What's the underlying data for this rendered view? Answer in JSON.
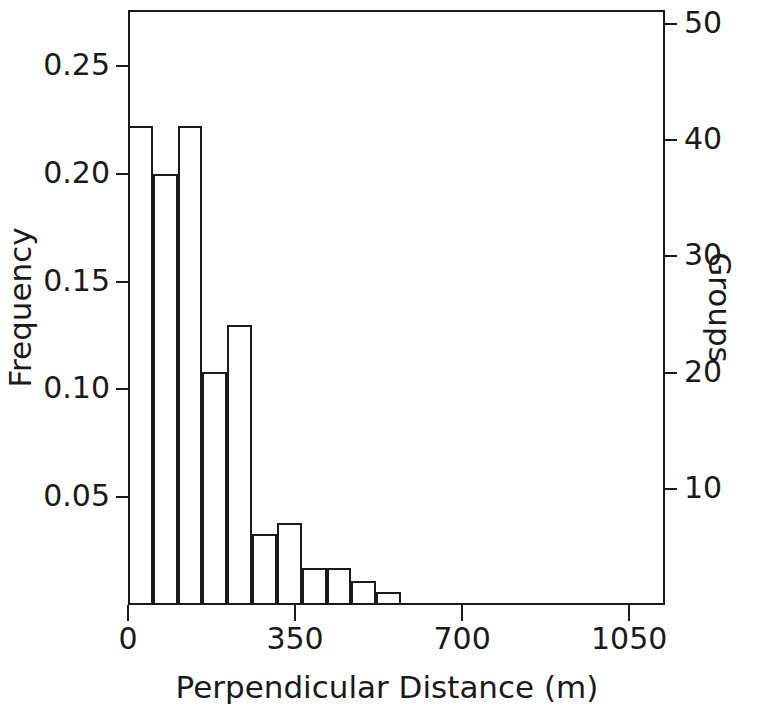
{
  "chart_data": {
    "type": "bar",
    "title": "",
    "subtitle": "",
    "xlabel": "Perpendicular  Distance  (m)",
    "ylabel": "Frequency",
    "y2label": "Groups",
    "grid": false,
    "legend": null,
    "xlim": [
      0,
      1125
    ],
    "ylim": [
      0,
      0.276
    ],
    "y2lim": [
      0,
      51.2
    ],
    "xticks": [
      0,
      350,
      700,
      1050
    ],
    "xticklabels": [
      "0",
      "350",
      "700",
      "1050"
    ],
    "yticks": [
      0.05,
      0.1,
      0.15,
      0.2,
      0.25
    ],
    "yticklabels": [
      "0.05",
      "0.10",
      "0.15",
      "0.20",
      "0.25"
    ],
    "y2ticks": [
      10,
      20,
      30,
      40,
      50
    ],
    "y2ticklabels": [
      "10",
      "20",
      "30",
      "40",
      "50"
    ],
    "bin_width": 52,
    "bin_edges": [
      0,
      52,
      104,
      156,
      208,
      260,
      312,
      364,
      416,
      468,
      520,
      572
    ],
    "categories": [
      "0-52",
      "52-104",
      "104-156",
      "156-208",
      "208-260",
      "260-312",
      "312-364",
      "364-416",
      "416-468",
      "468-520",
      "520-572"
    ],
    "values": [
      0.222,
      0.2,
      0.222,
      0.108,
      0.13,
      0.033,
      0.038,
      0.017,
      0.017,
      0.011,
      0.006
    ],
    "group_counts": [
      41,
      37,
      41,
      20,
      24,
      6,
      7,
      3,
      3,
      2,
      1
    ],
    "bars": [
      {
        "label": "0-52",
        "x0": 0,
        "x1": 52,
        "value": 0.222,
        "groups": 41
      },
      {
        "label": "52-104",
        "x0": 52,
        "x1": 104,
        "value": 0.2,
        "groups": 37
      },
      {
        "label": "104-156",
        "x0": 104,
        "x1": 156,
        "value": 0.222,
        "groups": 41
      },
      {
        "label": "156-208",
        "x0": 156,
        "x1": 208,
        "value": 0.108,
        "groups": 20
      },
      {
        "label": "208-260",
        "x0": 208,
        "x1": 260,
        "value": 0.13,
        "groups": 24
      },
      {
        "label": "260-312",
        "x0": 260,
        "x1": 312,
        "value": 0.033,
        "groups": 6
      },
      {
        "label": "312-364",
        "x0": 312,
        "x1": 364,
        "value": 0.038,
        "groups": 7
      },
      {
        "label": "364-416",
        "x0": 364,
        "x1": 416,
        "value": 0.017,
        "groups": 3
      },
      {
        "label": "416-468",
        "x0": 416,
        "x1": 468,
        "value": 0.017,
        "groups": 3
      },
      {
        "label": "468-520",
        "x0": 468,
        "x1": 520,
        "value": 0.011,
        "groups": 2
      },
      {
        "label": "520-572",
        "x0": 520,
        "x1": 572,
        "value": 0.006,
        "groups": 1
      }
    ],
    "colors": {
      "axis": "#1a1a1a",
      "bar_edge": "#1a1a1a",
      "bar_fill": "transparent",
      "background": "#ffffff"
    }
  }
}
